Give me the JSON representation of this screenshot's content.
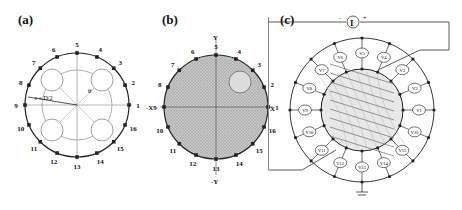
{
  "panels": {
    "a": {
      "label": "(a)",
      "electrodes": [
        "1",
        "2",
        "3",
        "4",
        "5",
        "6",
        "7",
        "8",
        "9",
        "10",
        "11",
        "12",
        "13",
        "14",
        "15",
        "16"
      ],
      "radius_label": "r = D/2",
      "inner_r_label": "r",
      "angle_label": "θ"
    },
    "b": {
      "label": "(b)",
      "electrodes": [
        "1",
        "2",
        "3",
        "4",
        "5",
        "6",
        "7",
        "8",
        "9",
        "10",
        "11",
        "12",
        "13",
        "14",
        "15",
        "16"
      ],
      "axes": {
        "y_pos": "Y",
        "y_neg": "-Y",
        "x_pos": "X",
        "x_neg": "-X"
      }
    },
    "c": {
      "label": "(c)",
      "current_source": "I",
      "plus": "+",
      "minus": "−",
      "x_label": "X",
      "voltmeters": [
        "V1",
        "V2",
        "V3",
        "V4",
        "V5",
        "V6",
        "V7",
        "V8",
        "V9",
        "V10",
        "V11",
        "V12",
        "V13",
        "V14",
        "V15",
        "V16"
      ]
    }
  },
  "colors": {
    "line": "#222222",
    "grid": "#9a9a9a",
    "fill": "#c8c8c8",
    "inclusion": "#dcdcdc"
  }
}
